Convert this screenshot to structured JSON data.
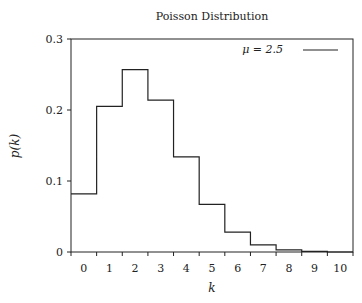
{
  "chart_data": {
    "type": "step",
    "title": "Poisson Distribution",
    "xlabel": "k",
    "ylabel": "p(k)",
    "categories": [
      "0",
      "1",
      "2",
      "3",
      "4",
      "5",
      "6",
      "7",
      "8",
      "9",
      "10"
    ],
    "series": [
      {
        "name": "μ = 2.5",
        "values": [
          0.082,
          0.205,
          0.257,
          0.214,
          0.134,
          0.067,
          0.028,
          0.01,
          0.003,
          0.001,
          0.0
        ]
      }
    ],
    "yticks": [
      "0",
      "0.1",
      "0.2",
      "0.3"
    ],
    "ylim": [
      0,
      0.3
    ],
    "xlim": [
      -0.5,
      10.5
    ],
    "grid": false,
    "legend_position": "top-right"
  },
  "legend": {
    "label": "μ = 2.5"
  }
}
